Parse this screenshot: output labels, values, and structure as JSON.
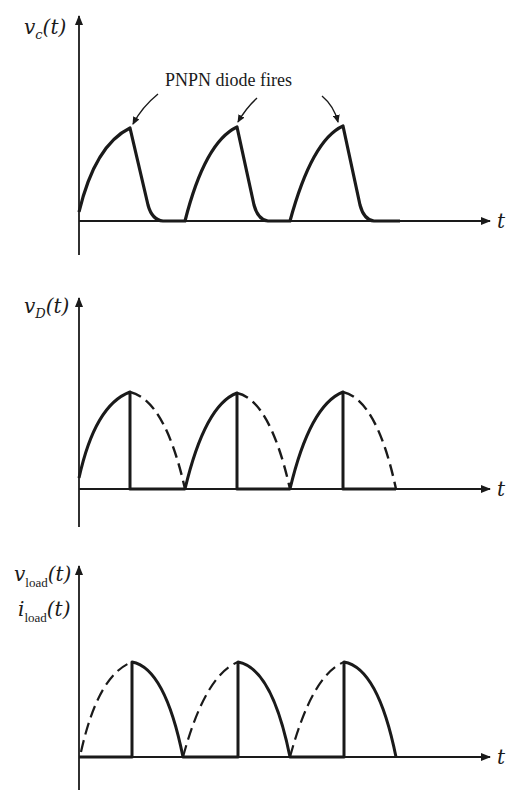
{
  "annotation": {
    "text": "PNPN diode fires"
  },
  "plots": [
    {
      "id": "vc",
      "ylabel_main": "v",
      "ylabel_sub": "c",
      "ylabel_arg": "(t)",
      "xlabel": "t",
      "description": "Capacitor voltage: rises like a sine until the PNPN diode fires at the peak, then drops rapidly to zero"
    },
    {
      "id": "vD",
      "ylabel_main": "v",
      "ylabel_sub": "D",
      "ylabel_arg": "(t)",
      "xlabel": "t",
      "description": "Diode voltage: follows the rising half of each half-sine (solid), drops to zero at firing; remaining half shown dashed"
    },
    {
      "id": "load",
      "ylabel_main": "v",
      "ylabel_sub": "load",
      "ylabel_arg": "(t)",
      "ylabel2_main": "i",
      "ylabel2_sub": "load",
      "ylabel2_arg": "(t)",
      "xlabel": "t",
      "description": "Load voltage/current: zero during first half (dashed), jumps to peak at firing and follows falling half of sine (solid)"
    }
  ],
  "colors": {
    "ink": "#1a1a1a",
    "background": "#ffffff"
  }
}
